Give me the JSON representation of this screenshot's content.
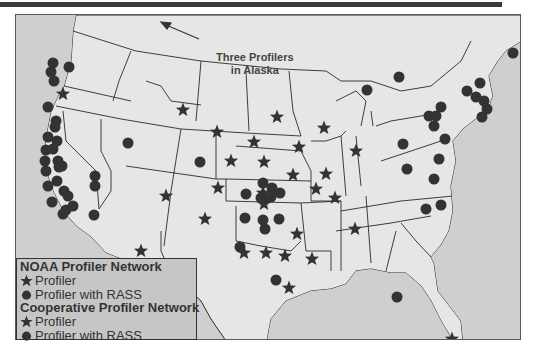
{
  "annotation": {
    "line1": "Three Profilers",
    "line2": "in Alaska"
  },
  "legend": {
    "noaa_header": "NOAA Profiler Network",
    "noaa_profiler": "Profiler",
    "noaa_rass": "Profiler with RASS",
    "coop_header": "Cooperative Profiler Network",
    "coop_profiler": "Profiler",
    "coop_rass": "Profiler with RASS"
  },
  "colors": {
    "land": "#e6e6e6",
    "ocean": "#cfcfcf",
    "border": "#2a2a2a",
    "marker": "#333333",
    "legend_bg": "#c6c6c6"
  },
  "markers": {
    "stars": [
      [
        62,
        93
      ],
      [
        182,
        109
      ],
      [
        216,
        131
      ],
      [
        253,
        141
      ],
      [
        276,
        116
      ],
      [
        323,
        127
      ],
      [
        230,
        160
      ],
      [
        263,
        161
      ],
      [
        298,
        146
      ],
      [
        355,
        150
      ],
      [
        165,
        195
      ],
      [
        217,
        187
      ],
      [
        262,
        192
      ],
      [
        292,
        174
      ],
      [
        315,
        188
      ],
      [
        325,
        173
      ],
      [
        334,
        197
      ],
      [
        204,
        218
      ],
      [
        263,
        203
      ],
      [
        296,
        233
      ],
      [
        243,
        252
      ],
      [
        265,
        252
      ],
      [
        284,
        255
      ],
      [
        311,
        258
      ],
      [
        354,
        228
      ],
      [
        288,
        287
      ],
      [
        140,
        250
      ],
      [
        451,
        338
      ]
    ],
    "dots": [
      [
        52,
        62
      ],
      [
        50,
        71
      ],
      [
        53,
        80
      ],
      [
        68,
        66
      ],
      [
        47,
        106
      ],
      [
        55,
        120
      ],
      [
        54,
        126
      ],
      [
        47,
        136
      ],
      [
        56,
        140
      ],
      [
        45,
        149
      ],
      [
        52,
        148
      ],
      [
        57,
        160
      ],
      [
        44,
        160
      ],
      [
        58,
        166
      ],
      [
        45,
        170
      ],
      [
        61,
        165
      ],
      [
        47,
        185
      ],
      [
        56,
        180
      ],
      [
        63,
        190
      ],
      [
        67,
        195
      ],
      [
        65,
        209
      ],
      [
        51,
        201
      ],
      [
        72,
        205
      ],
      [
        62,
        213
      ],
      [
        93,
        214
      ],
      [
        94,
        185
      ],
      [
        94,
        175
      ],
      [
        127,
        142
      ],
      [
        199,
        161
      ],
      [
        262,
        182
      ],
      [
        271,
        187
      ],
      [
        266,
        197
      ],
      [
        279,
        192
      ],
      [
        245,
        193
      ],
      [
        260,
        197
      ],
      [
        270,
        196
      ],
      [
        244,
        217
      ],
      [
        262,
        219
      ],
      [
        264,
        228
      ],
      [
        278,
        218
      ],
      [
        239,
        246
      ],
      [
        275,
        279
      ],
      [
        398,
        76
      ],
      [
        366,
        89
      ],
      [
        440,
        106
      ],
      [
        435,
        115
      ],
      [
        486,
        108
      ],
      [
        481,
        116
      ],
      [
        483,
        100
      ],
      [
        466,
        90
      ],
      [
        475,
        96
      ],
      [
        479,
        82
      ],
      [
        512,
        52
      ],
      [
        433,
        125
      ],
      [
        402,
        143
      ],
      [
        406,
        168
      ],
      [
        428,
        115
      ],
      [
        444,
        138
      ],
      [
        438,
        158
      ],
      [
        433,
        178
      ],
      [
        440,
        204
      ],
      [
        425,
        208
      ],
      [
        396,
        296
      ]
    ]
  }
}
